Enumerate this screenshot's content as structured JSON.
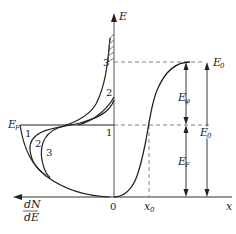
{
  "diagram": {
    "type": "energy-band / density-of-states diagram",
    "axes": {
      "vertical": {
        "label": "E"
      },
      "horizontal_right": {
        "label": "x"
      },
      "horizontal_left": {
        "label_numerator": "dN",
        "label_denominator": "dE"
      },
      "origin": {
        "label": "0"
      },
      "x0_tick": {
        "label": "x",
        "subscript": "0"
      }
    },
    "levels": {
      "fermi_left": {
        "label": "E",
        "subscript": "F"
      },
      "top_right": {
        "label": "E",
        "subscript": "0"
      },
      "dimension_work_function": {
        "label": "E",
        "subscript": "φ"
      },
      "dimension_fermi": {
        "label": "E",
        "subscript": "F"
      },
      "dimension_total": {
        "label": "E",
        "subscript": "0"
      }
    },
    "curve_labels": {
      "left_1": "1",
      "left_2": "2",
      "left_3": "3",
      "upper_2": "2",
      "upper_3": "3",
      "axis_1": "1"
    },
    "colors": {
      "stroke": "#222222",
      "axis": "#555555",
      "dashed": "#666666",
      "background": "#ffffff"
    },
    "caption": ""
  }
}
